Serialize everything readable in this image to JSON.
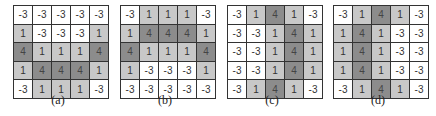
{
  "figure": {
    "colors": {
      "neg3": "#ffffff",
      "one": "#c8c8c8",
      "four": "#8c8c8c",
      "border": "#333333"
    },
    "panels": [
      {
        "label": "(a)",
        "rows": [
          [
            "-3",
            "-3",
            "-3",
            "-3",
            "-3"
          ],
          [
            "1",
            "-3",
            "-3",
            "-3",
            "1"
          ],
          [
            "4",
            "1",
            "1",
            "1",
            "4"
          ],
          [
            "1",
            "4",
            "4",
            "4",
            "1"
          ],
          [
            "-3",
            "1",
            "1",
            "1",
            "-3"
          ]
        ]
      },
      {
        "label": "(b)",
        "rows": [
          [
            "-3",
            "1",
            "1",
            "1",
            "-3"
          ],
          [
            "1",
            "4",
            "4",
            "4",
            "1"
          ],
          [
            "4",
            "1",
            "1",
            "1",
            "4"
          ],
          [
            "1",
            "-3",
            "-3",
            "-3",
            "1"
          ],
          [
            "-3",
            "-3",
            "-3",
            "-3",
            "-3"
          ]
        ]
      },
      {
        "label": "(c)",
        "rows": [
          [
            "-3",
            "1",
            "4",
            "1",
            "-3"
          ],
          [
            "-3",
            "-3",
            "1",
            "4",
            "1"
          ],
          [
            "-3",
            "-3",
            "1",
            "4",
            "1"
          ],
          [
            "-3",
            "-3",
            "1",
            "4",
            "1"
          ],
          [
            "-3",
            "1",
            "4",
            "1",
            "-3"
          ]
        ]
      },
      {
        "label": "(d)",
        "rows": [
          [
            "-3",
            "1",
            "4",
            "1",
            "-3"
          ],
          [
            "1",
            "4",
            "1",
            "-3",
            "-3"
          ],
          [
            "1",
            "4",
            "1",
            "-3",
            "-3"
          ],
          [
            "1",
            "4",
            "1",
            "-3",
            "-3"
          ],
          [
            "-3",
            "1",
            "4",
            "1",
            "-3"
          ]
        ]
      }
    ]
  }
}
